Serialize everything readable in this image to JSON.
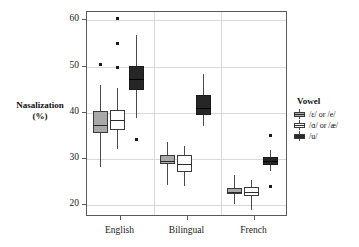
{
  "chart_data": {
    "type": "box",
    "title": "",
    "xlabel": "",
    "ylabel": "Nasalization (%)",
    "ylabel_line1": "Nasalization",
    "ylabel_line2": "(%)",
    "ylim": [
      17.5,
      61.8
    ],
    "yticks": [
      20,
      30,
      40,
      50,
      60
    ],
    "ytick_labels": [
      "20",
      "30",
      "40",
      "50",
      "60"
    ],
    "grid": "horizontal-and-vertical",
    "categories": [
      "English",
      "Bilingual",
      "French"
    ],
    "legend": {
      "title": "Vowel",
      "position": "right",
      "entries": [
        {
          "label": "/ɛ/ or /e/",
          "fill": "#a9a9a9",
          "key": "grey-box-key"
        },
        {
          "label": "/ɑ/ or /æ/",
          "fill": "#ffffff",
          "key": "white-box-key"
        },
        {
          "label": "/u/",
          "fill": "#262626",
          "key": "black-box-key"
        }
      ]
    },
    "series": [
      {
        "name": "/ɛ/ or /e/",
        "fill": "#a9a9a9",
        "boxes": [
          {
            "category": "English",
            "whisker_low": 28.4,
            "q1": 35.6,
            "median": 37.3,
            "q3": 40.3,
            "whisker_high": 46.1,
            "outliers": [
              50.5
            ]
          },
          {
            "category": "Bilingual",
            "whisker_low": 24.5,
            "q1": 28.9,
            "median": 29.6,
            "q3": 31.0,
            "whisker_high": 33.8,
            "outliers": []
          },
          {
            "category": "French",
            "whisker_low": 20.4,
            "q1": 22.4,
            "median": 23.0,
            "q3": 23.8,
            "whisker_high": 26.5,
            "outliers": []
          }
        ]
      },
      {
        "name": "/ɑ/ or /æ/",
        "fill": "#ffffff",
        "boxes": [
          {
            "category": "English",
            "whisker_low": 32.1,
            "q1": 36.3,
            "median": 38.4,
            "q3": 40.6,
            "whisker_high": 45.3,
            "outliers": [
              49.9,
              55.0,
              60.4
            ]
          },
          {
            "category": "Bilingual",
            "whisker_low": 24.3,
            "q1": 27.2,
            "median": 28.9,
            "q3": 30.8,
            "whisker_high": 32.9,
            "outliers": []
          },
          {
            "category": "French",
            "whisker_low": 19.1,
            "q1": 22.1,
            "median": 23.0,
            "q3": 23.9,
            "whisker_high": 25.4,
            "outliers": []
          }
        ]
      },
      {
        "name": "/u/",
        "fill": "#262626",
        "boxes": [
          {
            "category": "English",
            "whisker_low": 38.9,
            "q1": 44.9,
            "median": 47.3,
            "q3": 50.2,
            "whisker_high": 56.8,
            "outliers": [
              34.3
            ]
          },
          {
            "category": "Bilingual",
            "whisker_low": 37.2,
            "q1": 39.6,
            "median": 41.1,
            "q3": 43.9,
            "whisker_high": 48.5,
            "outliers": []
          },
          {
            "category": "French",
            "whisker_low": 27.5,
            "q1": 28.7,
            "median": 29.5,
            "q3": 30.5,
            "whisker_high": 32.0,
            "outliers": [
              35.1,
              24.0
            ]
          }
        ]
      }
    ]
  }
}
